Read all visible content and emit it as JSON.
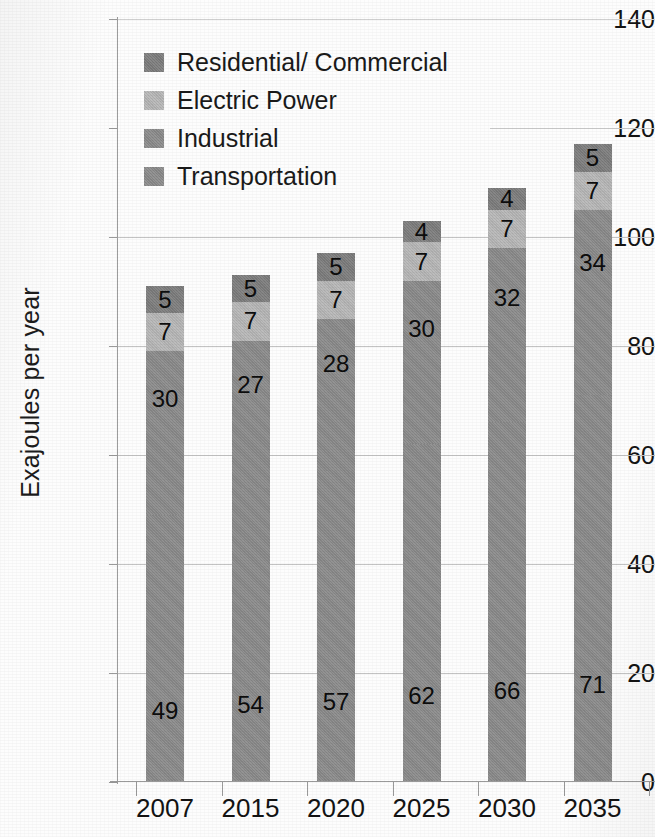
{
  "chart_data": {
    "type": "bar",
    "stacked": true,
    "title": "",
    "subtitle": "",
    "xlabel": "",
    "ylabel": "Exajoules per year",
    "categories": [
      "2007",
      "2015",
      "2020",
      "2025",
      "2030",
      "2035"
    ],
    "ylim": [
      0,
      140
    ],
    "yticks": [
      0,
      20,
      40,
      60,
      80,
      100,
      120,
      140
    ],
    "ytick_labels": [
      "0",
      "20",
      "40",
      "60",
      "80",
      "100",
      "120",
      "140"
    ],
    "grid": "horizontal",
    "legend_position": "upper-left-inside",
    "series": [
      {
        "name": "Transportation",
        "color": "#8c8c8c",
        "values": [
          49,
          54,
          57,
          62,
          66,
          71
        ],
        "labels": [
          "49",
          "54",
          "57",
          "62",
          "66",
          "71"
        ]
      },
      {
        "name": "Industrial",
        "color": "#8c8c8c",
        "values": [
          30,
          27,
          28,
          30,
          32,
          34
        ],
        "labels": [
          "30",
          "27",
          "28",
          "30",
          "32",
          "34"
        ]
      },
      {
        "name": "Electric Power",
        "color": "#b8b8b8",
        "values": [
          7,
          7,
          7,
          7,
          7,
          7
        ],
        "labels": [
          "7",
          "7",
          "7",
          "7",
          "7",
          "7"
        ]
      },
      {
        "name": "Residential/ Commercial",
        "color": "#7e7e7e",
        "values": [
          5,
          5,
          5,
          4,
          4,
          5
        ],
        "labels": [
          "5",
          "5",
          "5",
          "4",
          "4",
          "5"
        ]
      }
    ],
    "stack_totals": [
      91,
      94,
      97,
      103,
      110,
      117
    ],
    "legend_entries": [
      {
        "label": "Residential/ Commercial",
        "color": "#7e7e7e"
      },
      {
        "label": "Electric Power",
        "color": "#b8b8b8"
      },
      {
        "label": "Industrial",
        "color": "#8c8c8c"
      },
      {
        "label": "Transportation",
        "color": "#8c8c8c"
      }
    ],
    "colors": {
      "axis": "#9a9a9a",
      "gridline": "#c3c3c3",
      "text": "#141414",
      "background": "#fdfdfd"
    }
  }
}
